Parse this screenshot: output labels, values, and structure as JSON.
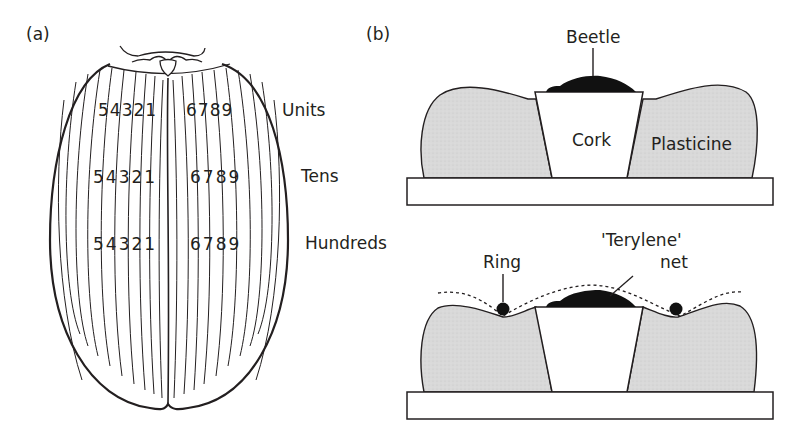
{
  "panel_a": {
    "label": "(a)",
    "rows": [
      {
        "name": "Units",
        "left_digits": "54321",
        "right_digits": "6789"
      },
      {
        "name": "Tens",
        "left_digits": "54321",
        "right_digits": "6789"
      },
      {
        "name": "Hundreds",
        "left_digits": "54321",
        "right_digits": "6789"
      }
    ],
    "left_digit_list": [
      "5",
      "4",
      "3",
      "2",
      "1"
    ],
    "right_digit_list": [
      "6",
      "7",
      "8",
      "9"
    ]
  },
  "panel_b": {
    "label": "(b)",
    "top": {
      "beetle_label": "Beetle",
      "cork_label": "Cork",
      "plasticine_label": "Plasticine"
    },
    "bottom": {
      "ring_label": "Ring",
      "net_label_line1": "'Terylene'",
      "net_label_line2": "net"
    }
  },
  "colors": {
    "ink": "#231f20",
    "plasticine_fill": "#dcdcdc",
    "background": "#ffffff"
  }
}
